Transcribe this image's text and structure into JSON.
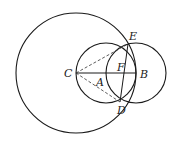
{
  "diagram": {
    "title": "",
    "points": {
      "C": {
        "label": "C"
      },
      "A": {
        "label": "A"
      },
      "B": {
        "label": "B"
      },
      "E": {
        "label": "E"
      },
      "D": {
        "label": "D"
      },
      "F": {
        "label": "F"
      }
    },
    "circles": [
      {
        "name": "circle-center-C-through-B",
        "center": "C",
        "through": "B"
      },
      {
        "name": "circle-on-diameter-CB",
        "center": "A",
        "through": [
          "C",
          "B"
        ]
      },
      {
        "name": "circle-center-B",
        "center": "B",
        "through": "A"
      }
    ],
    "segments": [
      {
        "from": "C",
        "to": "B",
        "style": "solid"
      },
      {
        "from": "E",
        "to": "D",
        "style": "solid"
      },
      {
        "from": "C",
        "to": "E",
        "style": "dashed"
      },
      {
        "from": "C",
        "to": "D",
        "style": "dashed"
      }
    ]
  }
}
